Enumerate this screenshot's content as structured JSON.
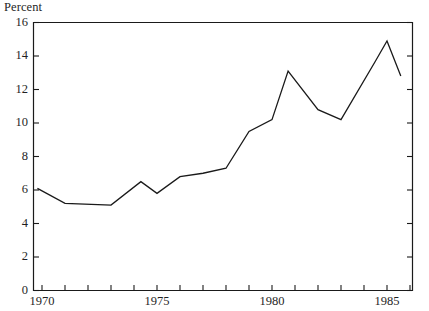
{
  "chart_data": {
    "type": "line",
    "title": "",
    "ylabel": "Percent",
    "xlabel": "",
    "ylim": [
      0,
      16
    ],
    "xlim": [
      1969.5,
      1986.0
    ],
    "yticks": [
      0,
      2,
      4,
      6,
      8,
      10,
      12,
      14,
      16
    ],
    "ytick_labels": [
      "0",
      "2",
      "4",
      "6",
      "8",
      "10",
      "12",
      "14",
      "16"
    ],
    "xticks": [
      1970,
      1971,
      1972,
      1973,
      1974,
      1975,
      1976,
      1977,
      1978,
      1979,
      1980,
      1981,
      1982,
      1983,
      1984,
      1985,
      1986
    ],
    "xtick_labels_shown": [
      "1970",
      "1975",
      "1980",
      "1985"
    ],
    "xtick_labels_values": [
      1970,
      1975,
      1980,
      1985
    ],
    "grid": false,
    "legend": false,
    "line_color": "#1a1a1a",
    "line_width": 1.3,
    "series": [
      {
        "name": "Percent",
        "x": [
          1969.8,
          1971.0,
          1973.0,
          1974.3,
          1975.0,
          1976.0,
          1977.0,
          1978.0,
          1979.0,
          1980.0,
          1980.7,
          1982.0,
          1983.0,
          1984.5,
          1985.0,
          1985.6
        ],
        "values": [
          6.1,
          5.2,
          5.1,
          6.5,
          5.8,
          6.8,
          7.0,
          7.3,
          9.5,
          10.2,
          13.1,
          10.8,
          10.2,
          13.7,
          14.9,
          12.8
        ]
      }
    ]
  }
}
